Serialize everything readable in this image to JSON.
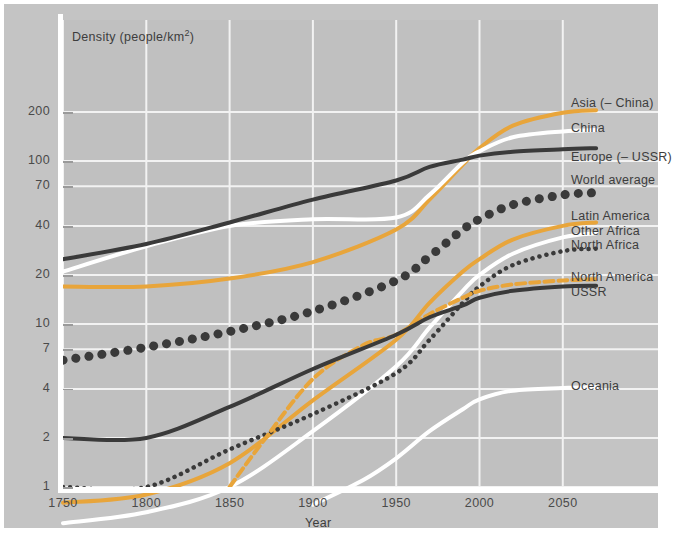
{
  "chart_data": {
    "type": "line",
    "title": "",
    "xlabel": "Year",
    "ylabel": "Density (people/km2)",
    "ylabel_base": "Density (people/km",
    "ylabel_sup": "2",
    "ylabel_tail": ")",
    "xlim": [
      1750,
      2070
    ],
    "ylim": [
      1,
      280
    ],
    "yscale": "log",
    "grid": true,
    "legend_position": "right-inline-labels",
    "yticks": [
      "1",
      "2",
      "4",
      "7",
      "10",
      "20",
      "40",
      "70",
      "100",
      "200"
    ],
    "ytick_values": [
      1,
      2,
      4,
      7,
      10,
      20,
      40,
      70,
      100,
      200
    ],
    "xticks": [
      "1750",
      "1800",
      "1850",
      "1900",
      "1950",
      "2000",
      "2050"
    ],
    "xtick_values": [
      1750,
      1800,
      1850,
      1900,
      1950,
      2000,
      2050
    ],
    "colors": {
      "orange": "#e8a53b",
      "white": "#ffffff",
      "dark": "#3a3a3a",
      "background": "#c4c4c4",
      "plot_background": "#c0c0c0",
      "gridline": "#f2f2f2",
      "text": "#3d3d3d"
    },
    "series": [
      {
        "name": "Asia (– China)",
        "label": "Asia (– China)",
        "color": "#e8a53b",
        "style": "solid",
        "label_y": 104,
        "x": [
          1750,
          1800,
          1850,
          1900,
          1950,
          1970,
          1990,
          2000,
          2020,
          2050,
          2070
        ],
        "y": [
          17,
          17,
          19,
          24,
          38,
          58,
          95,
          120,
          165,
          198,
          205
        ]
      },
      {
        "name": "China",
        "label": "China",
        "color": "#ffffff",
        "style": "solid",
        "label_y": 129,
        "x": [
          1750,
          1800,
          1850,
          1900,
          1950,
          1970,
          1990,
          2000,
          2020,
          2050,
          2070
        ],
        "y": [
          21,
          30,
          40,
          44,
          45,
          62,
          98,
          115,
          140,
          152,
          155
        ]
      },
      {
        "name": "Europe (– USSR)",
        "label": "Europe (– USSR)",
        "color": "#3a3a3a",
        "style": "solid",
        "label_y": 158,
        "x": [
          1750,
          1800,
          1850,
          1900,
          1950,
          1970,
          1990,
          2000,
          2020,
          2050,
          2070
        ],
        "y": [
          25,
          31,
          42,
          58,
          76,
          92,
          102,
          108,
          114,
          118,
          120
        ]
      },
      {
        "name": "World average",
        "label": "World average",
        "color": "#3a3a3a",
        "style": "dotted-large",
        "label_y": 181,
        "x": [
          1750,
          1800,
          1850,
          1900,
          1950,
          1970,
          1990,
          2000,
          2020,
          2050,
          2070
        ],
        "y": [
          6.0,
          7.2,
          9.0,
          12.0,
          18.5,
          26,
          38,
          44,
          54,
          62,
          64
        ]
      },
      {
        "name": "Latin America",
        "label": "Latin America",
        "color": "#e8a53b",
        "style": "solid",
        "label_y": 217,
        "x": [
          1750,
          1800,
          1850,
          1900,
          1950,
          1970,
          1990,
          2000,
          2020,
          2050,
          2070
        ],
        "y": [
          0.8,
          0.9,
          1.4,
          3.4,
          8.0,
          13.5,
          21,
          25,
          33,
          40,
          42
        ]
      },
      {
        "name": "Other Africa",
        "label": "Other Africa",
        "color": "#ffffff",
        "style": "solid",
        "label_y": 232,
        "x": [
          1750,
          1800,
          1850,
          1900,
          1950,
          1970,
          1990,
          2000,
          2020,
          2050,
          2070
        ],
        "y": [
          0.6,
          0.7,
          1.0,
          2.2,
          5.5,
          9.5,
          16,
          20,
          27,
          34,
          36
        ]
      },
      {
        "name": "North Africa",
        "label": "North Africa",
        "color": "#3a3a3a",
        "style": "dotted-small",
        "label_y": 246,
        "x": [
          1750,
          1800,
          1850,
          1900,
          1950,
          1970,
          1990,
          2000,
          2020,
          2050,
          2070
        ],
        "y": [
          1.0,
          1.0,
          1.7,
          2.8,
          5.0,
          8.0,
          13.5,
          17,
          23,
          28,
          29
        ]
      },
      {
        "name": "North America",
        "label": "North America",
        "color": "#e8a53b",
        "style": "dashed",
        "label_y": 278,
        "x": [
          1850,
          1870,
          1900,
          1930,
          1950,
          1970,
          1990,
          2000,
          2020,
          2050,
          2070
        ],
        "y": [
          1.0,
          1.9,
          4.6,
          7.4,
          8.6,
          11.5,
          14.5,
          16,
          17.5,
          18.5,
          18.8
        ]
      },
      {
        "name": "USSR",
        "label": "USSR",
        "color": "#3a3a3a",
        "style": "solid",
        "label_y": 293,
        "x": [
          1750,
          1800,
          1850,
          1900,
          1950,
          1970,
          1990,
          2000,
          2020,
          2050,
          2070
        ],
        "y": [
          2.0,
          2.0,
          3.1,
          5.3,
          8.6,
          11.0,
          13.0,
          14.5,
          16.0,
          17.0,
          17.2
        ]
      },
      {
        "name": "Oceania",
        "label": "Oceania",
        "color": "#ffffff",
        "style": "solid",
        "label_y": 387,
        "x": [
          1900,
          1930,
          1950,
          1970,
          1990,
          2000,
          2020,
          2050,
          2070
        ],
        "y": [
          0.78,
          1.1,
          1.5,
          2.2,
          3.0,
          3.45,
          3.9,
          4.05,
          4.1
        ]
      }
    ]
  },
  "axis": {
    "ytitle_base": "Density (people/km",
    "ytitle_sup": "2",
    "ytitle_tail": ")",
    "xtitle": "Year"
  }
}
